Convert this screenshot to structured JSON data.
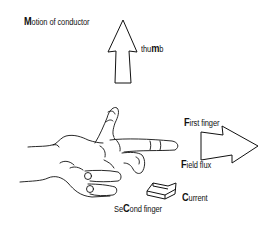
{
  "diagram": {
    "labels": {
      "motion": {
        "cap": "M",
        "rest": "otion of conductor"
      },
      "thumb": {
        "pre": "thu",
        "cap": "m",
        "post": "b"
      },
      "first_finger": {
        "cap": "F",
        "rest": "irst finger"
      },
      "field_flux": {
        "cap": "F",
        "rest": "ield flux"
      },
      "current": {
        "cap": "C",
        "rest": "urrent"
      },
      "second_finger": {
        "pre": "Se",
        "cap": "C",
        "post": "ond finger"
      }
    },
    "arrows": [
      {
        "name": "motion-arrow",
        "direction": "up"
      },
      {
        "name": "field-arrow",
        "direction": "right"
      },
      {
        "name": "current-arrow",
        "direction": "toward-viewer"
      }
    ],
    "colors": {
      "line": "#111111",
      "background": "#ffffff"
    }
  }
}
